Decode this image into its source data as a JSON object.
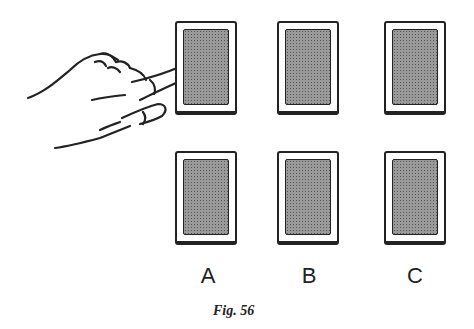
{
  "figure": {
    "caption": "Fig. 56",
    "columns": [
      {
        "label": "A",
        "cards": [
          "top",
          "bottom"
        ]
      },
      {
        "label": "B",
        "cards": [
          "top",
          "bottom"
        ]
      },
      {
        "label": "C",
        "cards": [
          "top",
          "bottom"
        ]
      }
    ],
    "pointing_at": "A top card",
    "icons": {
      "hand": "pointing-hand-icon",
      "card": "card-back-icon"
    }
  }
}
